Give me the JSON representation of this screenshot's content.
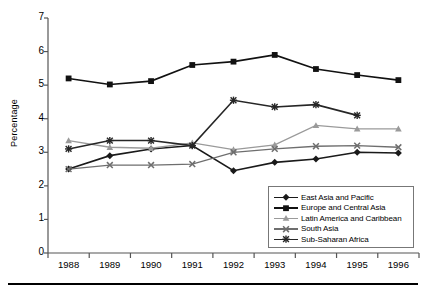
{
  "axes": {
    "ylabel": "Percentage",
    "yticks": [
      0,
      1,
      2,
      3,
      4,
      5,
      6,
      7
    ],
    "xticks": [
      "1988",
      "1989",
      "1990",
      "1991",
      "1992",
      "1993",
      "1994",
      "1995",
      "1996"
    ]
  },
  "legend": {
    "items": [
      {
        "label": "East Asia and Pacific",
        "marker": "diamond",
        "color": "#1a1a1a"
      },
      {
        "label": "Europe and Central Asia",
        "marker": "square",
        "color": "#111111"
      },
      {
        "label": "Latin America and Caribbean",
        "marker": "triangle",
        "color": "#9a9a9a"
      },
      {
        "label": "South Asia",
        "marker": "x",
        "color": "#6e6e6e"
      },
      {
        "label": "Sub-Saharan Africa",
        "marker": "asterisk",
        "color": "#262626"
      }
    ]
  },
  "chart_data": {
    "type": "line",
    "title": "",
    "xlabel": "",
    "ylabel": "Percentage",
    "categories": [
      "1988",
      "1989",
      "1990",
      "1991",
      "1992",
      "1993",
      "1994",
      "1995",
      "1996"
    ],
    "ylim": [
      0,
      7
    ],
    "xlim_note": "one category per year, ticks at category boundaries",
    "grid": false,
    "legend_position": "inside bottom-right",
    "series": [
      {
        "name": "East Asia and Pacific",
        "marker": "diamond",
        "color": "#1a1a1a",
        "values": [
          2.5,
          2.9,
          3.1,
          3.2,
          2.45,
          2.7,
          2.8,
          3.0,
          2.98
        ]
      },
      {
        "name": "Europe and Central Asia",
        "marker": "square",
        "color": "#111111",
        "values": [
          5.2,
          5.02,
          5.12,
          5.6,
          5.7,
          5.9,
          5.48,
          5.3,
          5.15
        ]
      },
      {
        "name": "Latin America and Caribbean",
        "marker": "triangle",
        "color": "#9a9a9a",
        "values": [
          3.35,
          3.15,
          3.12,
          3.28,
          3.08,
          3.22,
          3.8,
          3.7,
          3.7
        ]
      },
      {
        "name": "South Asia",
        "marker": "x",
        "color": "#6e6e6e",
        "values": [
          2.5,
          2.62,
          2.62,
          2.65,
          3.0,
          3.1,
          3.18,
          3.2,
          3.15
        ]
      },
      {
        "name": "Sub-Saharan Africa",
        "marker": "asterisk",
        "color": "#262626",
        "values": [
          3.1,
          3.35,
          3.35,
          3.2,
          4.55,
          4.35,
          4.42,
          4.1,
          null
        ]
      }
    ]
  }
}
